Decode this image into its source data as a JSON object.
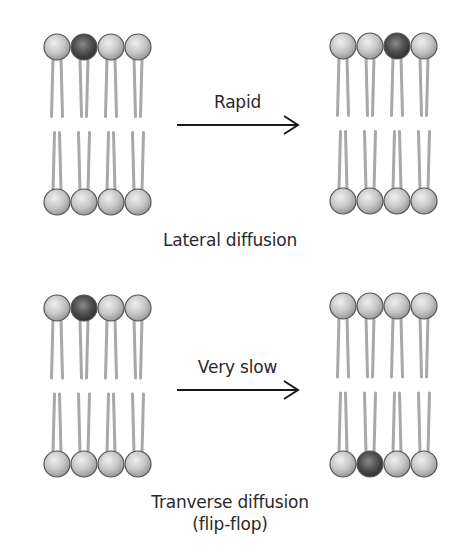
{
  "panels": [
    {
      "id": "lateral",
      "arrow_label": "Rapid",
      "caption": "Lateral diffusion",
      "before": {
        "top_dark_index": 1,
        "bottom_dark_index": -1
      },
      "after": {
        "top_dark_index": 2,
        "bottom_dark_index": -1
      }
    },
    {
      "id": "transverse",
      "arrow_label": "Very slow",
      "caption_line1": "Tranverse diffusion",
      "caption_line2": "(flip-flop)",
      "before": {
        "top_dark_index": 1,
        "bottom_dark_index": -1
      },
      "after": {
        "top_dark_index": -1,
        "bottom_dark_index": 1
      }
    }
  ],
  "colors": {
    "head_light": "#c9c9c9",
    "head_dark": "#4a4a4a",
    "tail": "#a8a8a8",
    "arrow": "#1a1a1a",
    "text": "#2a2a2a"
  }
}
